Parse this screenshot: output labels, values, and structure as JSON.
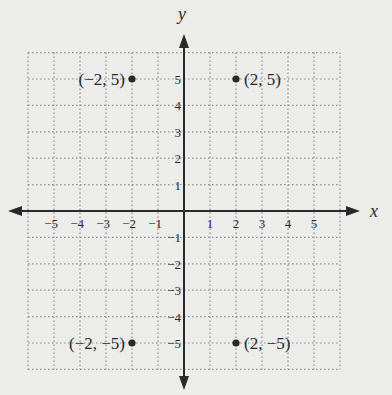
{
  "chart_data": {
    "type": "scatter",
    "title": "",
    "xlabel": "x",
    "ylabel": "y",
    "xlim": [
      -6,
      6
    ],
    "ylim": [
      -6,
      6
    ],
    "grid": true,
    "grid_style": "dotted",
    "x_ticks": [
      -5,
      -4,
      -3,
      -2,
      -1,
      1,
      2,
      3,
      4,
      5
    ],
    "y_ticks": [
      -5,
      -4,
      -3,
      -2,
      -1,
      1,
      2,
      3,
      4,
      5
    ],
    "x_tick_labels": [
      "−5",
      "−4",
      "−3",
      "−2",
      "−1",
      "1",
      "2",
      "3",
      "4",
      "5"
    ],
    "y_tick_labels": [
      "−5",
      "−4",
      "−3",
      "−2",
      "−1",
      "1",
      "2",
      "3",
      "4",
      "5"
    ],
    "points": [
      {
        "x": -2,
        "y": 5,
        "label": "(−2, 5)"
      },
      {
        "x": 2,
        "y": 5,
        "label": "(2, 5)"
      },
      {
        "x": -2,
        "y": -5,
        "label": "(−2, −5)"
      },
      {
        "x": 2,
        "y": -5,
        "label": "(2, −5)"
      }
    ]
  },
  "colors": {
    "background": "#ececea",
    "axis": "#2a2a2a",
    "grid": "#8a8a8a",
    "point": "#2a2a2a"
  }
}
